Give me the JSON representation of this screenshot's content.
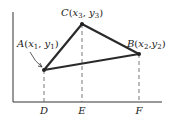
{
  "diagram": {
    "points": {
      "A": {
        "label": "A",
        "coords": "(x1, y1)",
        "sub1": "1",
        "sub2": "1"
      },
      "B": {
        "label": "B",
        "coords": "(x2, y2)",
        "sub1": "2",
        "sub2": "2"
      },
      "C": {
        "label": "C",
        "coords": "(x3, y3)",
        "sub1": "3",
        "sub2": "3"
      }
    },
    "axis_labels": {
      "D": "D",
      "E": "E",
      "F": "F"
    },
    "colors": {
      "line": "#2a2a2a",
      "dash": "#555555",
      "text": "#222222"
    }
  }
}
